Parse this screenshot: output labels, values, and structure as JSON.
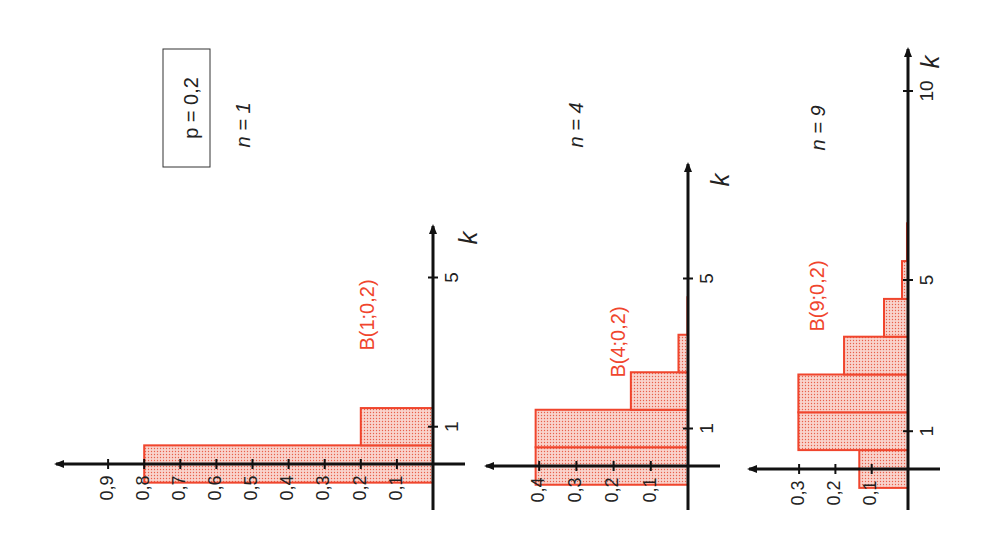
{
  "figure": {
    "parameter_box": "p = 0,2",
    "orientation": "rotated 90° counter-clockwise (k axis points up, probability axis points left)"
  },
  "colors": {
    "bar_stroke": "#f0452d",
    "bar_fill": "#f8c8c0",
    "bar_dots": "#e8503a",
    "label_red": "#f0452d",
    "axis": "#111111",
    "background": "#ffffff"
  },
  "panels": [
    {
      "n_label": "n = 1",
      "dist_label": "B(1;0,2)",
      "k_axis_label": "k",
      "k_ticks": [
        {
          "k": 1,
          "label": "1"
        },
        {
          "k": 5,
          "label": "5"
        }
      ],
      "p_ticks": [
        "0,1",
        "0,2",
        "0,3",
        "0,4",
        "0,5",
        "0,6",
        "0,7",
        "0,8",
        "0,9"
      ]
    },
    {
      "n_label": "n = 4",
      "dist_label": "B(4;0,2)",
      "k_axis_label": "k",
      "k_ticks": [
        {
          "k": 1,
          "label": "1"
        },
        {
          "k": 5,
          "label": "5"
        }
      ],
      "p_ticks": [
        "0,1",
        "0,2",
        "0,3",
        "0,4"
      ]
    },
    {
      "n_label": "n = 9",
      "dist_label": "B(9;0,2)",
      "k_axis_label": "k",
      "k_ticks": [
        {
          "k": 1,
          "label": "1"
        },
        {
          "k": 5,
          "label": "5"
        },
        {
          "k": 10,
          "label": "10"
        }
      ],
      "p_ticks": [
        "0,1",
        "0,2",
        "0,3"
      ]
    }
  ],
  "chart_data": [
    {
      "type": "bar",
      "title": "B(1;0,2)",
      "subtitle": "n = 1, p = 0,2",
      "xlabel": "k",
      "ylabel": "P(X = k)",
      "categories": [
        0,
        1
      ],
      "values": [
        0.8,
        0.2
      ],
      "xlim": [
        0,
        6
      ],
      "ylim": [
        0,
        1.0
      ],
      "y_ticks": [
        0.1,
        0.2,
        0.3,
        0.4,
        0.5,
        0.6,
        0.7,
        0.8,
        0.9
      ],
      "x_ticks": [
        1,
        5
      ],
      "grid": false,
      "legend": null
    },
    {
      "type": "bar",
      "title": "B(4;0,2)",
      "subtitle": "n = 4, p = 0,2",
      "xlabel": "k",
      "ylabel": "P(X = k)",
      "categories": [
        0,
        1,
        2,
        3,
        4
      ],
      "values": [
        0.4096,
        0.4096,
        0.1536,
        0.0256,
        0.0016
      ],
      "xlim": [
        0,
        8
      ],
      "ylim": [
        0,
        0.45
      ],
      "y_ticks": [
        0.1,
        0.2,
        0.3,
        0.4
      ],
      "x_ticks": [
        1,
        5
      ],
      "grid": false,
      "legend": null
    },
    {
      "type": "bar",
      "title": "B(9;0,2)",
      "subtitle": "n = 9, p = 0,2",
      "xlabel": "k",
      "ylabel": "P(X = k)",
      "categories": [
        0,
        1,
        2,
        3,
        4,
        5,
        6,
        7,
        8,
        9
      ],
      "values": [
        0.1342,
        0.302,
        0.302,
        0.1762,
        0.0661,
        0.0165,
        0.0028,
        0.0003,
        0.0,
        0.0
      ],
      "xlim": [
        0,
        11
      ],
      "ylim": [
        0,
        0.35
      ],
      "y_ticks": [
        0.1,
        0.2,
        0.3
      ],
      "x_ticks": [
        1,
        5,
        10
      ],
      "grid": false,
      "legend": null
    }
  ]
}
